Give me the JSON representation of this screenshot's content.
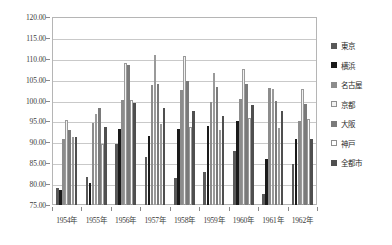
{
  "chart_data": {
    "type": "bar",
    "title": "",
    "xlabel": "",
    "ylabel": "",
    "ylim": [
      75.0,
      120.0
    ],
    "ytick_step": 5.0,
    "grid": true,
    "legend_position": "right",
    "categories": [
      "1954年",
      "1955年",
      "1956年",
      "1957年",
      "1958年",
      "1959年",
      "1960年",
      "1961年",
      "1962年"
    ],
    "ytick_labels": [
      "120.00",
      "115.00",
      "110.00",
      "105.00",
      "100.00",
      "95.00",
      "90.00",
      "85.00",
      "80.00",
      "75.00"
    ],
    "series": [
      {
        "name": "東京",
        "color": "#595959",
        "values": [
          79.0,
          81.8,
          89.6,
          86.5,
          81.4,
          82.8,
          87.9,
          77.6,
          84.9
        ]
      },
      {
        "name": "横浜",
        "color": "#1a1a1a",
        "values": [
          78.6,
          80.2,
          93.1,
          91.5,
          93.2,
          94.0,
          95.1,
          86.0,
          90.9
        ]
      },
      {
        "name": "名古屋",
        "color": "#8c8c8c",
        "values": [
          90.7,
          94.6,
          100.2,
          103.7,
          102.5,
          99.6,
          100.4,
          103.0,
          95.0
        ]
      },
      {
        "name": "京都",
        "color": "#f2f2f2",
        "values": [
          95.3,
          96.8,
          109.0,
          110.9,
          110.7,
          106.7,
          107.6,
          102.8,
          102.7
        ]
      },
      {
        "name": "大阪",
        "color": "#7a7a7a",
        "values": [
          93.0,
          98.3,
          108.4,
          104.0,
          104.7,
          103.3,
          103.9,
          99.9,
          99.1
        ]
      },
      {
        "name": "神戸",
        "color": "#ffffff",
        "values": [
          91.4,
          89.6,
          100.2,
          94.4,
          93.6,
          93.0,
          95.9,
          93.4,
          95.5
        ]
      },
      {
        "name": "全都市",
        "color": "#4f4f4f",
        "values": [
          91.4,
          93.6,
          99.3,
          98.2,
          97.6,
          96.3,
          98.9,
          97.6,
          90.8
        ]
      }
    ]
  }
}
